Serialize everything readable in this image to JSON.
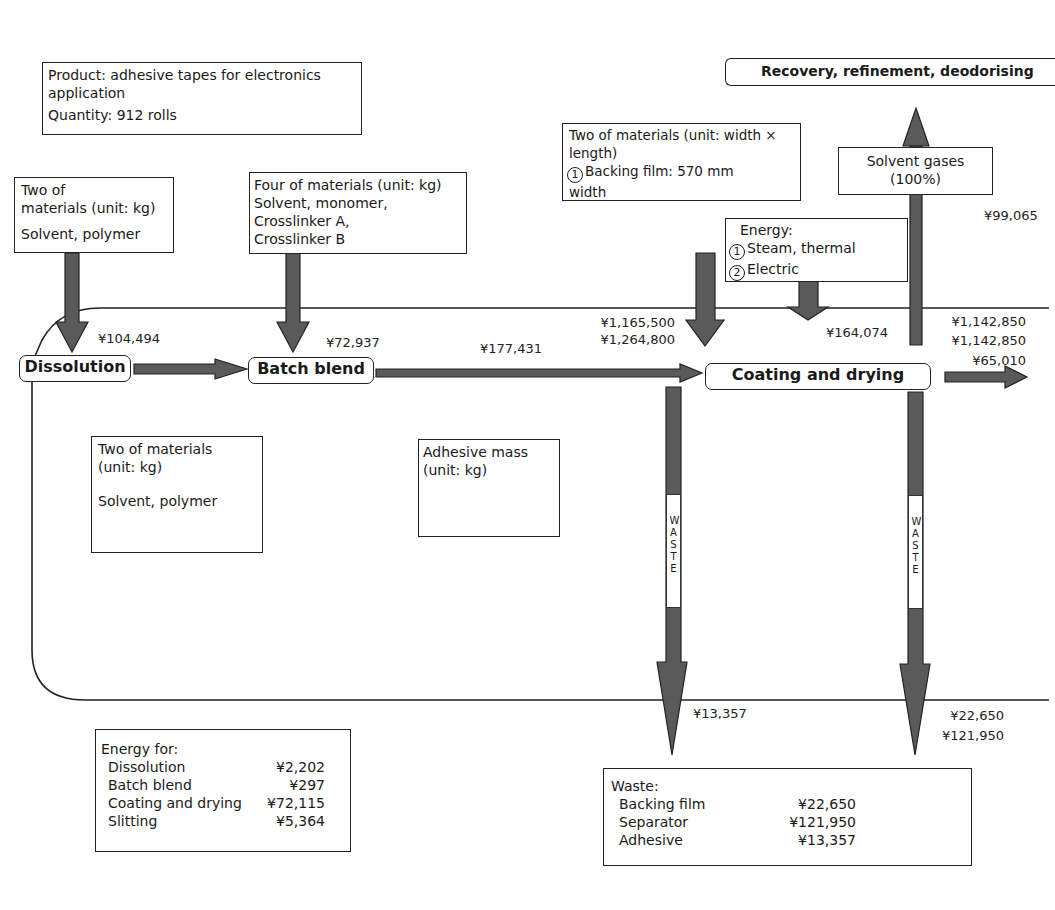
{
  "product_box": {
    "line1": "Product: adhesive tapes for electronics",
    "line2": "application",
    "line3": "Quantity: 912 rolls"
  },
  "recovery_box": {
    "label": "Recovery, refinement, deodorising"
  },
  "inputs": {
    "dissolution_materials": {
      "line1": "Two of",
      "line2": "materials (unit: kg)",
      "line3": "Solvent, polymer"
    },
    "batch_materials": {
      "line1": "Four of materials (unit: kg)",
      "line2": "Solvent, monomer,",
      "line3": "Crosslinker A,",
      "line4": "Crosslinker B"
    },
    "coating_materials": {
      "line1": "Two of materials (unit: width ×",
      "line2": "length)",
      "line3_num": "1",
      "line3": "Backing film: 570 mm",
      "line4": "width"
    },
    "energy": {
      "title": "Energy:",
      "item1_num": "1",
      "item1": "Steam, thermal",
      "item2_num": "2",
      "item2": "Electric"
    },
    "solvent_gases": {
      "line1": "Solvent gases",
      "line2": "(100%)"
    }
  },
  "processes": {
    "dissolution": "Dissolution",
    "batch_blend": "Batch blend",
    "coating_drying": "Coating and drying"
  },
  "values": {
    "dissolution_in": "¥104,494",
    "batch_in": "¥72,937",
    "batch_out": "¥177,431",
    "coating_material_in_1": "¥1,165,500",
    "coating_material_in_2": "¥1,264,800",
    "energy_in": "¥164,074",
    "solvent_gas_out": "¥99,065",
    "output_1": "¥1,142,850",
    "output_2": "¥1,142,850",
    "output_3": "¥65,010",
    "waste_left": "¥13,357",
    "waste_right_1": "¥22,650",
    "waste_right_2": "¥121,950"
  },
  "waste_arrow_label": "WASTE",
  "inner_boxes": {
    "dissolution_out": {
      "line1": "Two of materials",
      "line2": "(unit: kg)",
      "line3": "Solvent, polymer"
    },
    "adhesive_mass": {
      "line1": "Adhesive mass",
      "line2": "(unit: kg)"
    }
  },
  "energy_summary": {
    "title": "Energy for:",
    "rows": [
      {
        "label": "Dissolution",
        "value": "¥2,202"
      },
      {
        "label": "Batch blend",
        "value": "¥297"
      },
      {
        "label": "Coating and drying",
        "value": "¥72,115"
      },
      {
        "label": "Slitting",
        "value": "¥5,364"
      }
    ]
  },
  "waste_summary": {
    "title": "Waste:",
    "rows": [
      {
        "label": "Backing film",
        "value": "¥22,650"
      },
      {
        "label": "Separator",
        "value": "¥121,950"
      },
      {
        "label": "Adhesive",
        "value": "¥13,357"
      }
    ]
  },
  "colors": {
    "arrow_fill": "#5a5a5a",
    "outline": "#222222",
    "background": "#ffffff"
  }
}
